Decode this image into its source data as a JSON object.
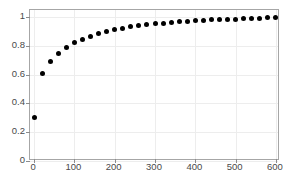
{
  "chart_data": {
    "type": "scatter",
    "title": "",
    "subtitle": "",
    "xlabel": "",
    "ylabel": "",
    "xlim": [
      -10,
      610
    ],
    "ylim": [
      0,
      1.05
    ],
    "grid": true,
    "legend": null,
    "marker": {
      "shape": "circle",
      "color": "#000000",
      "size_px": 5,
      "filled": true
    },
    "xticks": [
      0,
      100,
      200,
      300,
      400,
      500,
      600
    ],
    "xtick_labels": [
      "0",
      "100",
      "200",
      "300",
      "400",
      "500",
      "600"
    ],
    "yticks": [
      0,
      0.2,
      0.4,
      0.6,
      0.8,
      1
    ],
    "ytick_labels": [
      "0",
      "0.2",
      "0.4",
      "0.6",
      "0.8",
      "1"
    ],
    "x": [
      0,
      20,
      40,
      60,
      80,
      100,
      120,
      140,
      160,
      180,
      200,
      220,
      240,
      260,
      280,
      300,
      320,
      340,
      360,
      380,
      400,
      420,
      440,
      460,
      480,
      500,
      520,
      540,
      560,
      580,
      600
    ],
    "y": [
      0.3,
      0.605,
      0.693,
      0.749,
      0.789,
      0.822,
      0.847,
      0.868,
      0.886,
      0.901,
      0.913,
      0.924,
      0.933,
      0.941,
      0.948,
      0.954,
      0.959,
      0.964,
      0.968,
      0.972,
      0.975,
      0.978,
      0.981,
      0.983,
      0.985,
      0.987,
      0.989,
      0.991,
      0.993,
      0.995,
      0.997
    ],
    "series": [
      {
        "name": "",
        "x": [
          0,
          20,
          40,
          60,
          80,
          100,
          120,
          140,
          160,
          180,
          200,
          220,
          240,
          260,
          280,
          300,
          320,
          340,
          360,
          380,
          400,
          420,
          440,
          460,
          480,
          500,
          520,
          540,
          560,
          580,
          600
        ],
        "values": [
          0.3,
          0.605,
          0.693,
          0.749,
          0.789,
          0.822,
          0.847,
          0.868,
          0.886,
          0.901,
          0.913,
          0.924,
          0.933,
          0.941,
          0.948,
          0.954,
          0.959,
          0.964,
          0.968,
          0.972,
          0.975,
          0.978,
          0.981,
          0.983,
          0.985,
          0.987,
          0.989,
          0.991,
          0.993,
          0.995,
          0.997
        ]
      }
    ],
    "colors": {
      "marker": "#000000",
      "axis": "#a6a6a6",
      "grid": "#ededed",
      "tick_label": "#4a4a4a",
      "background": "#ffffff"
    }
  }
}
